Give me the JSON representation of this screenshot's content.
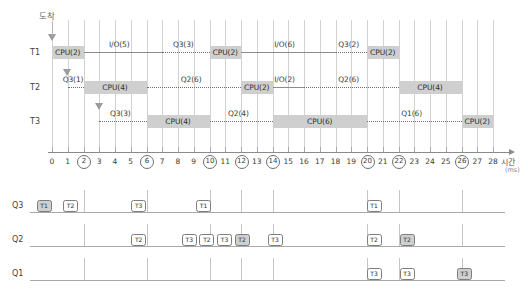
{
  "chart_data": {
    "type": "gantt",
    "xlabel": "시간",
    "xunit": "(ms)",
    "xlim": [
      0,
      28
    ],
    "x_ticks": [
      0,
      1,
      2,
      3,
      4,
      5,
      6,
      7,
      8,
      9,
      10,
      11,
      12,
      13,
      14,
      15,
      16,
      17,
      18,
      19,
      20,
      21,
      22,
      23,
      24,
      25,
      26,
      27,
      28
    ],
    "x_ticks_circled": [
      2,
      6,
      10,
      12,
      14,
      20,
      22,
      26
    ],
    "grid": true,
    "arrival_caption": "도착",
    "threads": [
      {
        "name": "T1",
        "arrival": 0,
        "segments": [
          {
            "kind": "cpu",
            "label": "CPU(2)",
            "start": 0,
            "end": 2
          },
          {
            "kind": "io",
            "label": "I/O(5)",
            "start": 2,
            "end": 7
          },
          {
            "kind": "wait",
            "label": "Q3(3)",
            "start": 7,
            "end": 10
          },
          {
            "kind": "cpu",
            "label": "CPU(2)",
            "start": 10,
            "end": 12
          },
          {
            "kind": "io",
            "label": "I/O(6)",
            "start": 12,
            "end": 18
          },
          {
            "kind": "wait",
            "label": "Q3(2)",
            "start": 18,
            "end": 20
          },
          {
            "kind": "cpu",
            "label": "CPU(2)",
            "start": 20,
            "end": 22
          }
        ]
      },
      {
        "name": "T2",
        "arrival": 1,
        "segments": [
          {
            "kind": "wait",
            "label": "Q3(1)",
            "start": 1,
            "end": 2
          },
          {
            "kind": "cpu",
            "label": "CPU(4)",
            "start": 2,
            "end": 6
          },
          {
            "kind": "wait",
            "label": "Q2(6)",
            "start": 6,
            "end": 12
          },
          {
            "kind": "cpu",
            "label": "CPU(2)",
            "start": 12,
            "end": 14
          },
          {
            "kind": "io",
            "label": "I/O(2)",
            "start": 14,
            "end": 16
          },
          {
            "kind": "wait",
            "label": "Q2(6)",
            "start": 16,
            "end": 22
          },
          {
            "kind": "cpu",
            "label": "CPU(4)",
            "start": 22,
            "end": 26
          }
        ]
      },
      {
        "name": "T3",
        "arrival": 3,
        "segments": [
          {
            "kind": "wait",
            "label": "Q3(3)",
            "start": 3,
            "end": 6
          },
          {
            "kind": "cpu",
            "label": "CPU(4)",
            "start": 6,
            "end": 10
          },
          {
            "kind": "wait",
            "label": "Q2(4)",
            "start": 10,
            "end": 14
          },
          {
            "kind": "cpu",
            "label": "CPU(6)",
            "start": 14,
            "end": 20
          },
          {
            "kind": "wait",
            "label": "Q1(6)",
            "start": 20,
            "end": 26
          },
          {
            "kind": "cpu",
            "label": "CPU(2)",
            "start": 26,
            "end": 28
          }
        ]
      }
    ],
    "queues": [
      {
        "name": "Q3",
        "separators": [
          2,
          6,
          10,
          12,
          14,
          20,
          22,
          26
        ],
        "tokens": [
          {
            "label": "T1",
            "at": 0.6,
            "filled": true
          },
          {
            "label": "T2",
            "at": 3.0,
            "filled": false
          },
          {
            "label": "T3",
            "at": 9.2,
            "filled": false
          },
          {
            "label": "T1",
            "at": 15.1,
            "filled": false
          },
          {
            "label": "T1",
            "at": 30.6,
            "filled": false
          }
        ]
      },
      {
        "name": "Q2",
        "separators": [
          2,
          6,
          10,
          12,
          14,
          20,
          22,
          26
        ],
        "tokens": [
          {
            "label": "T2",
            "at": 9.2,
            "filled": false
          },
          {
            "label": "T3",
            "at": 13.8,
            "filled": false
          },
          {
            "label": "T2",
            "at": 15.4,
            "filled": false
          },
          {
            "label": "T3",
            "at": 17.0,
            "filled": false
          },
          {
            "label": "T2",
            "at": 18.6,
            "filled": true
          },
          {
            "label": "T3",
            "at": 21.6,
            "filled": false
          },
          {
            "label": "T2",
            "at": 30.6,
            "filled": false
          },
          {
            "label": "T2",
            "at": 33.6,
            "filled": true
          }
        ]
      },
      {
        "name": "Q1",
        "separators": [
          2,
          6,
          10,
          12,
          14,
          20,
          22,
          26
        ],
        "tokens": [
          {
            "label": "T3",
            "at": 30.6,
            "filled": false
          },
          {
            "label": "T3",
            "at": 33.6,
            "filled": false
          },
          {
            "label": "T3",
            "at": 38.8,
            "filled": true
          }
        ]
      }
    ]
  }
}
